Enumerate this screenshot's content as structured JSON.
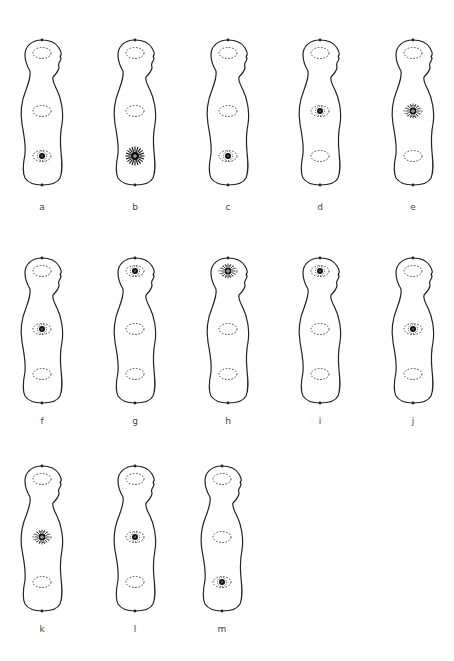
{
  "figure": {
    "colors": {
      "outline": "#222222",
      "ring": "#333333",
      "spot": "#111111",
      "label": "#444444"
    },
    "panels": [
      {
        "id": "a",
        "label": "a",
        "x": 2,
        "y": 38,
        "active_region": "lower",
        "intensity": "small"
      },
      {
        "id": "b",
        "label": "b",
        "x": 95,
        "y": 38,
        "active_region": "lower",
        "intensity": "large"
      },
      {
        "id": "c",
        "label": "c",
        "x": 188,
        "y": 38,
        "active_region": "lower",
        "intensity": "small"
      },
      {
        "id": "d",
        "label": "d",
        "x": 280,
        "y": 38,
        "active_region": "chest",
        "intensity": "small"
      },
      {
        "id": "e",
        "label": "e",
        "x": 373,
        "y": 38,
        "active_region": "chest",
        "intensity": "medium"
      },
      {
        "id": "f",
        "label": "f",
        "x": 2,
        "y": 256,
        "active_region": "chest",
        "intensity": "small"
      },
      {
        "id": "g",
        "label": "g",
        "x": 95,
        "y": 256,
        "active_region": "head",
        "intensity": "small"
      },
      {
        "id": "h",
        "label": "h",
        "x": 188,
        "y": 256,
        "active_region": "head",
        "intensity": "medium"
      },
      {
        "id": "i",
        "label": "i",
        "x": 280,
        "y": 256,
        "active_region": "head",
        "intensity": "small"
      },
      {
        "id": "j",
        "label": "j",
        "x": 373,
        "y": 256,
        "active_region": "chest",
        "intensity": "small"
      },
      {
        "id": "k",
        "label": "k",
        "x": 2,
        "y": 464,
        "active_region": "chest",
        "intensity": "medium"
      },
      {
        "id": "l",
        "label": "l",
        "x": 95,
        "y": 464,
        "active_region": "chest",
        "intensity": "small"
      },
      {
        "id": "m",
        "label": "m",
        "x": 182,
        "y": 464,
        "active_region": "lower",
        "intensity": "small"
      }
    ]
  }
}
